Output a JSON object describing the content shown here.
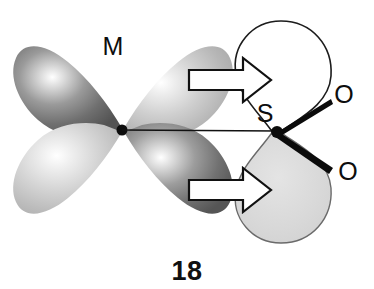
{
  "figure": {
    "number_label": "18",
    "caption": "",
    "background_color": "#ffffff"
  },
  "atoms": [
    {
      "id": "metal",
      "label": "M",
      "x": 113,
      "y": 45,
      "role": "metal-center"
    },
    {
      "id": "sulfur",
      "label": "S",
      "x": 262,
      "y": 123,
      "role": "sulfur-center"
    },
    {
      "id": "oxygen-1",
      "label": "O",
      "x": 340,
      "y": 100,
      "role": "oxygen-upper"
    },
    {
      "id": "oxygen-2",
      "label": "O",
      "x": 345,
      "y": 172,
      "role": "oxygen-lower"
    }
  ],
  "orbitals": {
    "metal_orbital": {
      "name": "metal-d-orbital",
      "lobe_count": 4,
      "lobes": [
        {
          "position": "upper-left",
          "phase": "dark",
          "fill": "#6e6e6e"
        },
        {
          "position": "upper-right",
          "phase": "light",
          "fill": "#c9c9c9"
        },
        {
          "position": "lower-left",
          "phase": "light",
          "fill": "#cccccc"
        },
        {
          "position": "lower-right",
          "phase": "dark",
          "fill": "#707070"
        }
      ]
    },
    "sulfur_orbital": {
      "name": "sulfur-p-orbital",
      "lobe_count": 2,
      "lobes": [
        {
          "position": "upper",
          "phase": "empty",
          "fill": "#ffffff",
          "stroke": "#1a1a1a"
        },
        {
          "position": "lower",
          "phase": "filled",
          "fill": "#d6d6d6",
          "stroke": "#1a1a1a"
        }
      ]
    }
  },
  "bonds": [
    {
      "id": "m-s-bond",
      "from": "metal",
      "to": "sulfur",
      "style": "thin-line"
    },
    {
      "id": "s-o1-bond",
      "from": "sulfur",
      "to": "oxygen-1",
      "style": "bold-wedge"
    },
    {
      "id": "s-o2-bond",
      "from": "sulfur",
      "to": "oxygen-2",
      "style": "bold-wedge"
    }
  ],
  "arrows": [
    {
      "id": "overlap-arrow-upper",
      "direction": "right",
      "label": "",
      "y": 80
    },
    {
      "id": "overlap-arrow-lower",
      "direction": "right",
      "label": "",
      "y": 190
    }
  ],
  "colors": {
    "outline": "#1a1a1a",
    "bond": "#111111",
    "lobe_dark": "#6e6e6e",
    "lobe_light": "#c9c9c9",
    "sulfur_lobe_fill": "#d6d6d6",
    "arrow_fill": "#ffffff",
    "arrow_stroke": "#111111"
  }
}
